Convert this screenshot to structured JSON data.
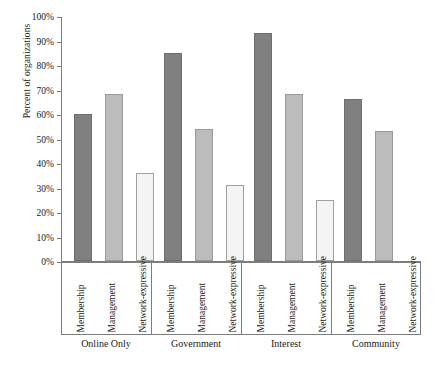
{
  "chart_data": {
    "type": "bar",
    "title": "",
    "xlabel": "",
    "ylabel": "Percent of organizations",
    "ylim": [
      0,
      100
    ],
    "ytick_labels": [
      "0%",
      "10%",
      "20%",
      "30%",
      "40%",
      "50%",
      "60%",
      "70%",
      "80%",
      "90%",
      "100%"
    ],
    "ytick_values": [
      0,
      10,
      20,
      30,
      40,
      50,
      60,
      70,
      80,
      90,
      100
    ],
    "grid": false,
    "legend": "none",
    "categories": [
      "Online Only",
      "Government",
      "Interest",
      "Community"
    ],
    "subcategories": [
      "Membership",
      "Management",
      "Network-expressive"
    ],
    "series": [
      {
        "name": "Membership",
        "color": "#808080",
        "values": [
          60,
          85,
          93,
          66
        ]
      },
      {
        "name": "Management",
        "color": "#bcbcbc",
        "values": [
          68,
          54,
          68,
          53
        ]
      },
      {
        "name": "Network-expressive",
        "color": "#f4f4f4",
        "values": [
          36,
          31,
          25,
          0
        ]
      }
    ],
    "groups": [
      {
        "label": "Online Only",
        "bars": [
          {
            "label": "Membership",
            "value": 60
          },
          {
            "label": "Management",
            "value": 68
          },
          {
            "label": "Network-expressive",
            "value": 36
          }
        ]
      },
      {
        "label": "Government",
        "bars": [
          {
            "label": "Membership",
            "value": 85
          },
          {
            "label": "Management",
            "value": 54
          },
          {
            "label": "Network-expressive",
            "value": 31
          }
        ]
      },
      {
        "label": "Interest",
        "bars": [
          {
            "label": "Membership",
            "value": 93
          },
          {
            "label": "Management",
            "value": 68
          },
          {
            "label": "Network-expressive",
            "value": 25
          }
        ]
      },
      {
        "label": "Community",
        "bars": [
          {
            "label": "Membership",
            "value": 66
          },
          {
            "label": "Management",
            "value": 53
          },
          {
            "label": "Network-expressive",
            "value": 0
          }
        ]
      }
    ]
  }
}
